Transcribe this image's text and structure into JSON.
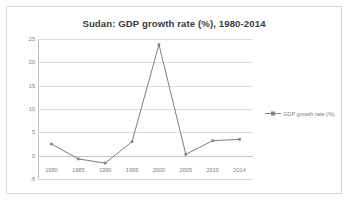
{
  "chart_data": {
    "type": "line",
    "title": "Sudan: GDP growth rate (%), 1980-2014",
    "xlabel": "",
    "ylabel": "",
    "categories": [
      "1980",
      "1985",
      "1990",
      "1995",
      "2000",
      "2005",
      "2010",
      "2014"
    ],
    "series": [
      {
        "name": "GDP growth rate (%)",
        "values": [
          2.5,
          -0.7,
          -1.6,
          3.0,
          23.8,
          0.3,
          3.2,
          3.5
        ]
      }
    ],
    "ylim": [
      -5,
      25
    ],
    "yticks": [
      25,
      20,
      15,
      10,
      5,
      0,
      -5
    ],
    "ytick_labels": [
      "25",
      "20",
      "15",
      "10",
      "5",
      "0",
      "-5"
    ],
    "grid": true,
    "legend_position": "right",
    "line_color": "#808080",
    "marker_color": "#808080",
    "gridline_color": "#dcdcdc",
    "title_color": "#3b3b3b",
    "tick_label_color": "#808080",
    "border_color": "#d9d9d9",
    "background_color": "#ffffff"
  },
  "legend": {
    "marker_icon": "line-marker-icon",
    "label": "GDP growth rate (%)"
  }
}
